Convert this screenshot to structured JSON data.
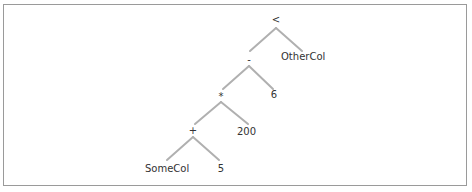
{
  "diagram": {
    "type": "expression-tree",
    "colors": {
      "edge": "#b0b0b0",
      "text": "#333333",
      "border": "#9a9a9a"
    },
    "nodes": {
      "lt": {
        "label": "<",
        "x": 276,
        "y": 20
      },
      "minus": {
        "label": "-",
        "x": 249,
        "y": 60
      },
      "othercol": {
        "label": "OtherCol",
        "x": 281,
        "y": 57
      },
      "times": {
        "label": "*",
        "x": 221,
        "y": 96
      },
      "six": {
        "label": "6",
        "x": 274,
        "y": 95
      },
      "plus": {
        "label": "+",
        "x": 193,
        "y": 131
      },
      "twohundred": {
        "label": "200",
        "x": 237,
        "y": 132
      },
      "somecol": {
        "label": "SomeCol",
        "x": 145,
        "y": 169
      },
      "five": {
        "label": "5",
        "x": 220,
        "y": 169
      }
    },
    "edges": [
      [
        "<",
        "-"
      ],
      [
        "<",
        "OtherCol"
      ],
      [
        "-",
        "*"
      ],
      [
        "-",
        "6"
      ],
      [
        "*",
        "+"
      ],
      [
        "*",
        "200"
      ],
      [
        "+",
        "SomeCol"
      ],
      [
        "+",
        "5"
      ]
    ]
  }
}
